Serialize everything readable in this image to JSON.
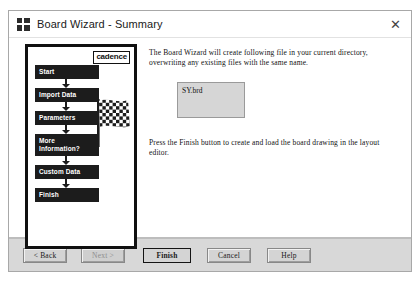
{
  "window": {
    "title": "Board Wizard - Summary",
    "app_icon": "grid-icon",
    "close_label": "✕"
  },
  "left_panel": {
    "logo_text": "cadence",
    "flow_steps": [
      {
        "label": "Start"
      },
      {
        "label": "Import Data"
      },
      {
        "label": "Parameters"
      },
      {
        "label": "More\nInformation?"
      },
      {
        "label": "Custom Data"
      },
      {
        "label": "Finish"
      }
    ],
    "flag": "checkered-flag-icon"
  },
  "content": {
    "paragraph_1": "The Board Wizard will create following file in your current directory, overwriting any existing files with the same name.",
    "file_list": [
      "SY.brd"
    ],
    "paragraph_2": "Press the Finish button to create and load the board drawing in the layout editor."
  },
  "footer": {
    "back_label": "< Back",
    "next_label": "Next >",
    "finish_label": "Finish",
    "cancel_label": "Cancel",
    "help_label": "Help"
  },
  "colors": {
    "flow_box": "#1c1c1c",
    "dialog_face": "#d8d8d8",
    "list_face": "#d6d6d6",
    "border": "#a8a8a8"
  }
}
